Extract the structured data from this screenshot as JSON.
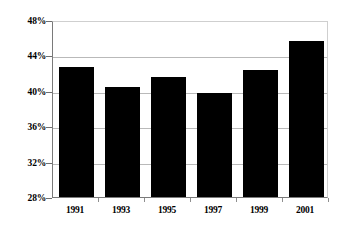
{
  "chart_data": {
    "type": "bar",
    "title": "",
    "subtitle": "",
    "xlabel": "",
    "ylabel": "",
    "categories": [
      "1991",
      "1993",
      "1995",
      "1997",
      "1999",
      "2001"
    ],
    "values": [
      42.7,
      40.4,
      41.6,
      39.7,
      42.4,
      45.6
    ],
    "value_labels": [
      "",
      "",
      "",
      "",
      "",
      ""
    ],
    "ylim": [
      28,
      48
    ],
    "ytick_values": [
      28,
      32,
      36,
      40,
      44,
      48
    ],
    "ytick_labels": [
      "28%",
      "32%",
      "36%",
      "40%",
      "44%",
      "48%"
    ],
    "grid": true,
    "grid_axis": "y",
    "legend": false,
    "legend_position": "none",
    "series": [
      {
        "name": "",
        "color": "#000000",
        "values": [
          42.7,
          40.4,
          41.6,
          39.7,
          42.4,
          45.6
        ]
      }
    ],
    "annotations": []
  },
  "colors": {
    "bar": "#000000",
    "gridline": "#b9b9b9",
    "axis": "#7a7a7a",
    "background": "#ffffff",
    "text": "#000000"
  }
}
